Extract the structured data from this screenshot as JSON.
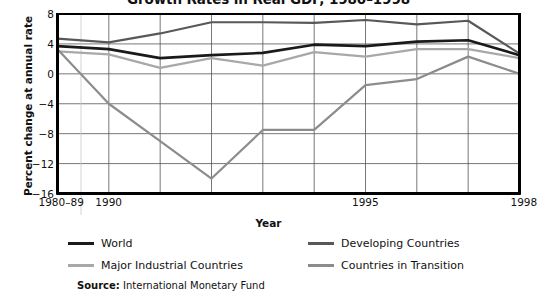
{
  "chart_data": {
    "type": "line",
    "title": "Growth Rates in Real GDP, 1980–1998",
    "xlabel": "Year",
    "ylabel": "Percent change at annual rate",
    "source_label": "Source:",
    "source_text": "International Monetary Fund",
    "x": [
      "1980–89",
      "1990",
      "1991",
      "1992",
      "1993",
      "1994",
      "1995",
      "1996",
      "1997",
      "1998"
    ],
    "xticks": [
      {
        "label": "1980–89",
        "x": "1980–89"
      },
      {
        "label": "1990",
        "x": "1990"
      },
      {
        "label": "1995",
        "x": "1995"
      },
      {
        "label": "1998",
        "x": "1998"
      }
    ],
    "yticks": [
      8,
      4,
      0,
      -4,
      -8,
      -12,
      -16
    ],
    "ylim": [
      -16,
      8
    ],
    "grid": true,
    "legend_position": "below",
    "series": [
      {
        "name": "World",
        "color": "#1a1a1a",
        "values": [
          3.7,
          3.3,
          2.1,
          2.5,
          2.8,
          3.9,
          3.7,
          4.3,
          4.5,
          2.5
        ]
      },
      {
        "name": "Developing Countries",
        "color": "#585858",
        "values": [
          4.7,
          4.2,
          5.4,
          6.9,
          6.9,
          6.8,
          7.2,
          6.6,
          7.1,
          2.7
        ]
      },
      {
        "name": "Major Industrial Countries",
        "color": "#a8a8a8",
        "values": [
          3.0,
          2.6,
          0.8,
          2.1,
          1.1,
          2.9,
          2.3,
          3.3,
          3.3,
          2.1
        ]
      },
      {
        "name": "Countries in Transition",
        "color": "#8c8c8c",
        "values": [
          3.3,
          -4.0,
          -9.0,
          -14.0,
          -7.5,
          -7.5,
          -1.5,
          -0.7,
          2.3,
          0.0
        ]
      }
    ]
  }
}
